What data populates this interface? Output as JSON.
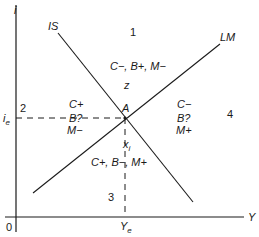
{
  "diagram": {
    "axes": {
      "y_label": "i",
      "x_label": "Y",
      "origin": "0",
      "y_tick": {
        "base": "i",
        "sub": "e"
      },
      "x_tick": {
        "base": "Y",
        "sub": "e"
      }
    },
    "curves": {
      "is_label": "IS",
      "lm_label": "LM"
    },
    "point": {
      "label": "A",
      "z_label": "z",
      "x_label_base": "x",
      "x_label_sub": "i"
    },
    "regions": [
      {
        "number": "1",
        "lines": [
          "C−, B+, M−"
        ]
      },
      {
        "number": "2",
        "lines": [
          "C+",
          "B?",
          "M−"
        ]
      },
      {
        "number": "3",
        "lines": [
          "C+, B−, M+"
        ]
      },
      {
        "number": "4",
        "lines": [
          "C−",
          "B?",
          "M+"
        ]
      }
    ],
    "colors": {
      "line": "#1a1a1a",
      "background": "#ffffff"
    }
  }
}
